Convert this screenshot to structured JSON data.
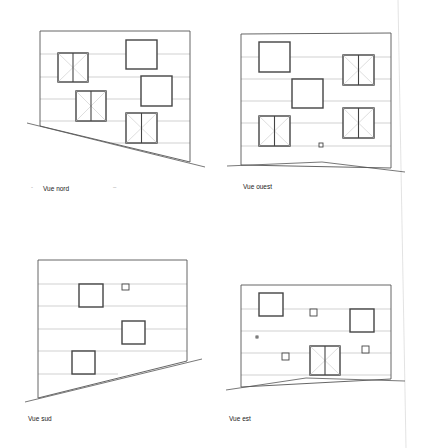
{
  "document": {
    "type": "facade elevations",
    "colors": {
      "wall_line": "#555555",
      "floor_line": "#bdbdbd",
      "window_frame": "#444444",
      "window_cross": "#c8c8c8",
      "ground": "#555555",
      "page_edge": "#dcdcdc"
    }
  },
  "views": [
    {
      "id": "nord",
      "label": "Vue nord",
      "label_pos": [
        43,
        185
      ],
      "extra_marks": [
        {
          "text": "-",
          "pos": [
            31,
            184
          ]
        },
        {
          "text": "–",
          "pos": [
            113,
            184
          ]
        }
      ],
      "wall": [
        [
          40,
          31
        ],
        [
          190,
          31
        ],
        [
          190,
          162
        ],
        [
          40,
          126
        ]
      ],
      "floor_lines": [
        {
          "y": 54,
          "x1": 40,
          "x2": 190
        },
        {
          "y": 77,
          "x1": 40,
          "x2": 190
        },
        {
          "y": 99,
          "x1": 40,
          "x2": 190
        },
        {
          "y": 121,
          "x1": 40,
          "x2": 190
        },
        {
          "y": 143,
          "x1": 111,
          "x2": 190
        }
      ],
      "ground": [
        [
          27,
          123
        ],
        [
          205,
          167
        ]
      ],
      "openings": [
        {
          "kind": "door",
          "x": 58,
          "y": 53,
          "w": 30,
          "h": 29
        },
        {
          "kind": "door",
          "x": 76,
          "y": 91,
          "w": 30,
          "h": 30
        },
        {
          "kind": "square",
          "x": 126,
          "y": 40,
          "w": 31,
          "h": 29
        },
        {
          "kind": "square",
          "x": 141,
          "y": 76,
          "w": 31,
          "h": 30
        },
        {
          "kind": "door",
          "x": 126,
          "y": 113,
          "w": 31,
          "h": 30
        }
      ]
    },
    {
      "id": "ouest",
      "label": "Vue ouest",
      "label_pos": [
        243,
        183
      ],
      "extra_marks": [],
      "wall": [
        [
          241,
          34
        ],
        [
          391,
          33
        ],
        [
          391,
          168
        ],
        [
          241,
          165
        ]
      ],
      "floor_lines": [
        {
          "y": 57,
          "x1": 241,
          "x2": 391
        },
        {
          "y": 79,
          "x1": 241,
          "x2": 391
        },
        {
          "y": 101,
          "x1": 241,
          "x2": 391
        },
        {
          "y": 123,
          "x1": 241,
          "x2": 391
        },
        {
          "y": 146,
          "x1": 241,
          "x2": 391
        }
      ],
      "ground": [
        [
          227,
          166
        ],
        [
          322,
          162
        ],
        [
          405,
          172
        ]
      ],
      "openings": [
        {
          "kind": "square",
          "x": 259,
          "y": 42,
          "w": 31,
          "h": 30
        },
        {
          "kind": "door",
          "x": 343,
          "y": 55,
          "w": 31,
          "h": 30
        },
        {
          "kind": "square",
          "x": 292,
          "y": 79,
          "w": 31,
          "h": 29
        },
        {
          "kind": "door",
          "x": 259,
          "y": 116,
          "w": 31,
          "h": 30
        },
        {
          "kind": "door",
          "x": 343,
          "y": 108,
          "w": 31,
          "h": 30
        },
        {
          "kind": "square",
          "x": 319,
          "y": 143,
          "w": 4,
          "h": 4
        }
      ]
    },
    {
      "id": "sud",
      "label": "Vue sud",
      "label_pos": [
        28,
        415
      ],
      "extra_marks": [],
      "wall": [
        [
          38,
          260
        ],
        [
          187,
          260
        ],
        [
          187,
          361
        ],
        [
          38,
          398
        ]
      ],
      "floor_lines": [
        {
          "y": 284,
          "x1": 38,
          "x2": 187
        },
        {
          "y": 306,
          "x1": 38,
          "x2": 187
        },
        {
          "y": 329,
          "x1": 38,
          "x2": 187
        },
        {
          "y": 351,
          "x1": 38,
          "x2": 187
        },
        {
          "y": 374,
          "x1": 38,
          "x2": 118
        }
      ],
      "ground": [
        [
          25,
          402
        ],
        [
          202,
          359
        ]
      ],
      "openings": [
        {
          "kind": "square",
          "x": 79,
          "y": 284,
          "w": 24,
          "h": 23
        },
        {
          "kind": "square",
          "x": 122,
          "y": 284,
          "w": 7,
          "h": 6
        },
        {
          "kind": "square",
          "x": 122,
          "y": 321,
          "w": 23,
          "h": 23
        },
        {
          "kind": "square",
          "x": 72,
          "y": 351,
          "w": 23,
          "h": 23
        }
      ]
    },
    {
      "id": "est",
      "label": "Vue est",
      "label_pos": [
        229,
        415
      ],
      "extra_marks": [],
      "wall": [
        [
          241,
          285
        ],
        [
          391,
          285
        ],
        [
          391,
          379
        ],
        [
          241,
          387
        ]
      ],
      "floor_lines": [
        {
          "y": 309,
          "x1": 241,
          "x2": 391
        },
        {
          "y": 331,
          "x1": 241,
          "x2": 391
        },
        {
          "y": 353,
          "x1": 241,
          "x2": 391
        },
        {
          "y": 375,
          "x1": 241,
          "x2": 391
        }
      ],
      "ground": [
        [
          226,
          390
        ],
        [
          306,
          378
        ],
        [
          405,
          381
        ]
      ],
      "openings": [
        {
          "kind": "square",
          "x": 259,
          "y": 293,
          "w": 24,
          "h": 23
        },
        {
          "kind": "square",
          "x": 310,
          "y": 309,
          "w": 7,
          "h": 7
        },
        {
          "kind": "square",
          "x": 350,
          "y": 309,
          "w": 24,
          "h": 23
        },
        {
          "kind": "square",
          "x": 256,
          "y": 336,
          "w": 2,
          "h": 2
        },
        {
          "kind": "square",
          "x": 282,
          "y": 353,
          "w": 7,
          "h": 7
        },
        {
          "kind": "door",
          "x": 310,
          "y": 346,
          "w": 30,
          "h": 29
        },
        {
          "kind": "square",
          "x": 362,
          "y": 346,
          "w": 7,
          "h": 7
        }
      ]
    }
  ],
  "page_edge": {
    "x1": 398,
    "y1": 0,
    "x2": 406,
    "y2": 448
  }
}
